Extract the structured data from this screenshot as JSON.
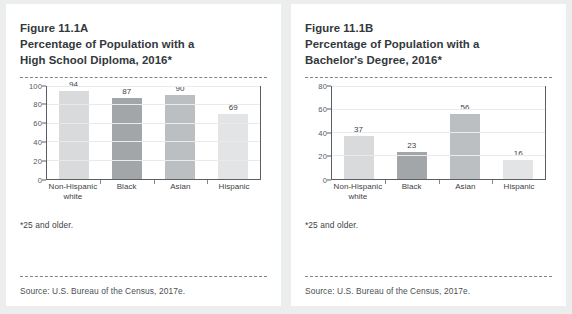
{
  "page": {
    "background_color": "#eceded",
    "panel_background": "#ffffff"
  },
  "panels": [
    {
      "figure_label": "Figure 11.1A",
      "title": "Figure 11.1A\nPercentage of Population with a\nHigh School Diploma, 2016*",
      "footnote": "*25 and older.",
      "source": "Source: U.S. Bureau of the Census, 2017e.",
      "chart_data": {
        "type": "bar",
        "title": "Percentage of Population with a High School Diploma, 2016*",
        "categories": [
          "Non-Hispanic\nwhite",
          "Black",
          "Asian",
          "Hispanic"
        ],
        "values": [
          94,
          87,
          90,
          69
        ],
        "bar_colors": [
          "#d9dadb",
          "#a3a6a8",
          "#bcbfc1",
          "#e3e4e5"
        ],
        "xlabel": "",
        "ylabel": "",
        "ylim": [
          0,
          100
        ],
        "yticks": [
          0,
          20,
          40,
          60,
          80,
          100
        ],
        "grid": true,
        "legend": "none",
        "data_labels": true
      }
    },
    {
      "figure_label": "Figure 11.1B",
      "title": "Figure 11.1B\nPercentage of Population with a\nBachelor's Degree, 2016*",
      "footnote": "*25 and older.",
      "source": "Source: U.S. Bureau of the Census, 2017e.",
      "chart_data": {
        "type": "bar",
        "title": "Percentage of Population with a Bachelor's Degree, 2016*",
        "categories": [
          "Non-Hispanic\nwhite",
          "Black",
          "Asian",
          "Hispanic"
        ],
        "values": [
          37,
          23,
          56,
          16
        ],
        "bar_colors": [
          "#d9dadb",
          "#a3a6a8",
          "#bcbfc1",
          "#e3e4e5"
        ],
        "xlabel": "",
        "ylabel": "",
        "ylim": [
          0,
          80
        ],
        "yticks": [
          0,
          20,
          40,
          60,
          80
        ],
        "grid": true,
        "legend": "none",
        "data_labels": true
      }
    }
  ]
}
